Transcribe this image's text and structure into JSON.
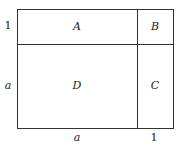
{
  "diagram": {
    "regions": [
      {
        "name": "A",
        "label": "A"
      },
      {
        "name": "B",
        "label": "B"
      },
      {
        "name": "C",
        "label": "C"
      },
      {
        "name": "D",
        "label": "D"
      }
    ],
    "side_labels": {
      "left_top": "1",
      "left_bottom": "a",
      "bottom_left": "a",
      "bottom_right": "1"
    }
  }
}
